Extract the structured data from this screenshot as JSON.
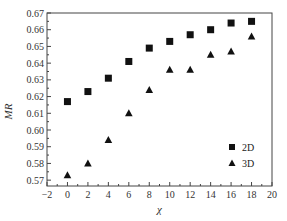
{
  "chart_data": {
    "type": "scatter",
    "title": "",
    "xlabel": "χ",
    "ylabel": "MR",
    "xlim": [
      -2,
      20
    ],
    "ylim": [
      0.5665,
      0.67
    ],
    "xticks": [
      -2,
      0,
      2,
      4,
      6,
      8,
      10,
      12,
      14,
      16,
      18,
      20
    ],
    "yticks": [
      0.57,
      0.58,
      0.59,
      0.6,
      0.61,
      0.62,
      0.63,
      0.64,
      0.65,
      0.66,
      0.67
    ],
    "ytick_labels": [
      "0.57",
      "0.58",
      "0.59",
      "0.60",
      "0.61",
      "0.62",
      "0.63",
      "0.64",
      "0.65",
      "0.66",
      "0.67"
    ],
    "grid": false,
    "legend_position": "lower right",
    "x": [
      0,
      2,
      4,
      6,
      8,
      10,
      12,
      14,
      16,
      18
    ],
    "series": [
      {
        "name": "2D",
        "marker": "square",
        "values": [
          0.617,
          0.623,
          0.631,
          0.641,
          0.649,
          0.653,
          0.657,
          0.66,
          0.664,
          0.665
        ]
      },
      {
        "name": "3D",
        "marker": "triangle",
        "values": [
          0.573,
          0.58,
          0.594,
          0.61,
          0.624,
          0.636,
          0.636,
          0.645,
          0.647,
          0.656
        ]
      }
    ]
  },
  "legend": {
    "items": [
      {
        "label": "2D"
      },
      {
        "label": "3D"
      }
    ]
  }
}
